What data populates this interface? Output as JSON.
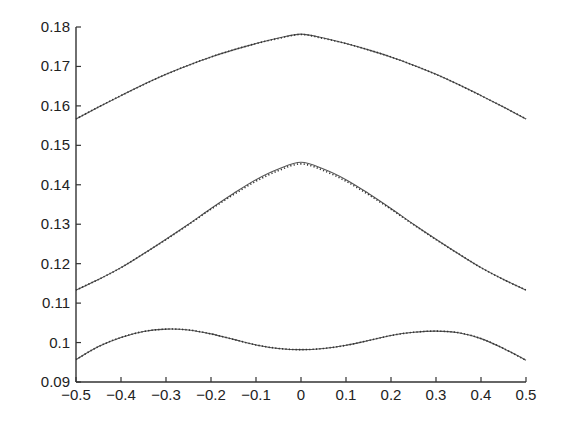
{
  "chart_data": {
    "type": "line",
    "title": "",
    "xlabel": "",
    "ylabel": "",
    "xlim": [
      -0.5,
      0.5
    ],
    "ylim": [
      0.09,
      0.18
    ],
    "grid": false,
    "legend": "none",
    "x_ticks": [
      -0.5,
      -0.4,
      -0.3,
      -0.2,
      -0.1,
      0,
      0.1,
      0.2,
      0.3,
      0.4,
      0.5
    ],
    "x_tick_labels": [
      "−0.5",
      "−0.4",
      "−0.3",
      "−0.2",
      "−0.1",
      "0",
      "0.1",
      "0.2",
      "0.3",
      "0.4",
      "0.5"
    ],
    "y_ticks": [
      0.09,
      0.1,
      0.11,
      0.12,
      0.13,
      0.14,
      0.15,
      0.16,
      0.17,
      0.18
    ],
    "y_tick_labels": [
      "0.09",
      "0.1",
      "0.11",
      "0.12",
      "0.13",
      "0.14",
      "0.15",
      "0.16",
      "0.17",
      "0.18"
    ],
    "x": [
      -0.5,
      -0.45,
      -0.4,
      -0.35,
      -0.3,
      -0.25,
      -0.2,
      -0.15,
      -0.1,
      -0.05,
      0,
      0.05,
      0.1,
      0.15,
      0.2,
      0.25,
      0.3,
      0.35,
      0.4,
      0.45,
      0.5
    ],
    "series": [
      {
        "name": "upper-solid",
        "style": "solid",
        "values": [
          0.1567,
          0.1597,
          0.1626,
          0.1654,
          0.168,
          0.1703,
          0.1724,
          0.1742,
          0.1758,
          0.1772,
          0.1782,
          0.1772,
          0.1758,
          0.1742,
          0.1724,
          0.1703,
          0.168,
          0.1654,
          0.1626,
          0.1597,
          0.1567
        ]
      },
      {
        "name": "upper-dotted",
        "style": "dotted",
        "values": [
          0.1567,
          0.1597,
          0.1626,
          0.1654,
          0.168,
          0.1703,
          0.1724,
          0.1742,
          0.1758,
          0.1771,
          0.1781,
          0.1771,
          0.1758,
          0.1742,
          0.1724,
          0.1703,
          0.168,
          0.1654,
          0.1626,
          0.1597,
          0.1567
        ]
      },
      {
        "name": "middle-solid",
        "style": "solid",
        "values": [
          0.1133,
          0.116,
          0.119,
          0.1225,
          0.1262,
          0.13,
          0.134,
          0.1378,
          0.1413,
          0.144,
          0.1457,
          0.144,
          0.1413,
          0.1378,
          0.134,
          0.13,
          0.1262,
          0.1225,
          0.119,
          0.116,
          0.1133
        ]
      },
      {
        "name": "middle-dotted",
        "style": "dotted",
        "values": [
          0.1133,
          0.116,
          0.119,
          0.1225,
          0.1261,
          0.1299,
          0.1338,
          0.1375,
          0.1409,
          0.1436,
          0.1453,
          0.1436,
          0.1409,
          0.1375,
          0.1338,
          0.1299,
          0.1261,
          0.1225,
          0.119,
          0.116,
          0.1133
        ]
      },
      {
        "name": "lower-solid",
        "style": "solid",
        "values": [
          0.0957,
          0.099,
          0.1013,
          0.1028,
          0.1034,
          0.1032,
          0.1022,
          0.1008,
          0.0994,
          0.0985,
          0.0982,
          0.0985,
          0.0993,
          0.1005,
          0.1018,
          0.1026,
          0.1029,
          0.1025,
          0.101,
          0.0985,
          0.0955
        ]
      },
      {
        "name": "lower-dotted",
        "style": "dotted",
        "values": [
          0.0957,
          0.099,
          0.1013,
          0.1028,
          0.1034,
          0.1032,
          0.1022,
          0.1008,
          0.0994,
          0.0985,
          0.0982,
          0.0985,
          0.0993,
          0.1005,
          0.1018,
          0.1026,
          0.1029,
          0.1025,
          0.101,
          0.0985,
          0.0955
        ]
      }
    ]
  }
}
